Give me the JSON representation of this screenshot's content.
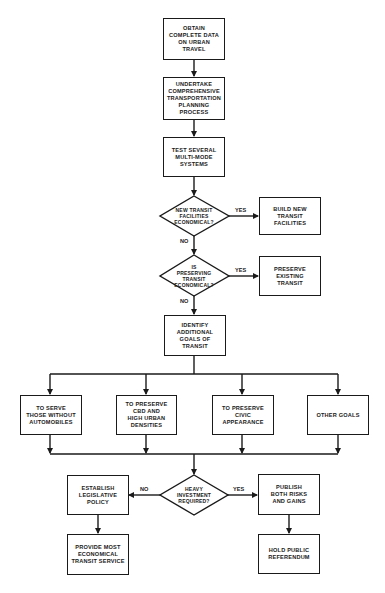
{
  "flowchart": {
    "start": [
      {
        "id": "obtain",
        "text": "OBTAIN\nCOMPLETE DATA\nON URBAN\nTRAVEL"
      },
      {
        "id": "undertake",
        "text": "UNDERTAKE\nCOMPREHENSIVE\nTRANSPORTATION\nPLANNING\nPROCESS"
      },
      {
        "id": "test",
        "text": "TEST SEVERAL\nMULTI-MODE\nSYSTEMS"
      }
    ],
    "decision1": {
      "question": "NEW TRANSIT\nFACILITIES\nECONOMICAL?",
      "yes_label": "YES",
      "no_label": "NO",
      "yes_action": "BUILD NEW\nTRANSIT\nFACILITIES"
    },
    "decision2": {
      "question": "IS\nPRESERVING\nTRANSIT\nECONOMICAL?",
      "yes_label": "YES",
      "no_label": "NO",
      "yes_action": "PRESERVE\nEXISTING\nTRANSIT"
    },
    "identify": {
      "text": "IDENTIFY\nADDITIONAL\nGOALS OF\nTRANSIT"
    },
    "goals": [
      {
        "text": "TO SERVE\nTHOSE WITHOUT\nAUTOMOBILES"
      },
      {
        "text": "TO PRESERVE\nCBD AND\nHIGH URBAN\nDENSITIES"
      },
      {
        "text": "TO PRESERVE\nCIVIC\nAPPEARANCE"
      },
      {
        "text": "OTHER GOALS"
      }
    ],
    "decision3": {
      "question": "HEAVY\nINVESTMENT\nREQUIRED?",
      "yes_label": "YES",
      "no_label": "NO",
      "no_path": [
        {
          "text": "ESTABLISH\nLEGISLATIVE\nPOLICY"
        },
        {
          "text": "PROVIDE MOST\nECONOMICAL\nTRANSIT SERVICE"
        }
      ],
      "yes_path": [
        {
          "text": "PUBLISH\nBOTH RISKS\nAND GAINS"
        },
        {
          "text": "HOLD PUBLIC\nREFERENDUM"
        }
      ]
    },
    "colors": {
      "line": "#1a1a1a",
      "background": "#ffffff"
    }
  }
}
